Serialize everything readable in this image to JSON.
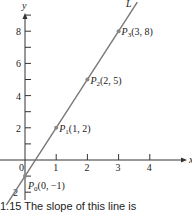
{
  "chart_data": {
    "type": "line",
    "title": "",
    "xlabel": "x",
    "ylabel": "y",
    "xlim": [
      -0.6,
      4.9
    ],
    "ylim": [
      -2.6,
      9.5
    ],
    "x_ticks": [
      "0",
      "1",
      "2",
      "3",
      "4"
    ],
    "y_ticks": [
      "-2",
      "2",
      "4",
      "6",
      "8"
    ],
    "grid": false,
    "series": [
      {
        "name": "L",
        "x": [
          -0.6,
          3.6
        ],
        "y": [
          -2.8,
          9.8
        ]
      }
    ],
    "points": [
      {
        "label": "P0(0, −1)",
        "name": "P",
        "sub": "0",
        "coords": "(0, −1)",
        "x": 0,
        "y": -1
      },
      {
        "label": "P1(1, 2)",
        "name": "P",
        "sub": "1",
        "coords": "(1, 2)",
        "x": 1,
        "y": 2
      },
      {
        "label": "P2(2, 5)",
        "name": "P",
        "sub": "2",
        "coords": "(2, 5)",
        "x": 2,
        "y": 5
      },
      {
        "label": "P3(3, 8)",
        "name": "P",
        "sub": "3",
        "coords": "(3, 8)",
        "x": 3,
        "y": 8
      }
    ],
    "line_label": "L"
  },
  "caption": "1.15   The slope of this line is"
}
